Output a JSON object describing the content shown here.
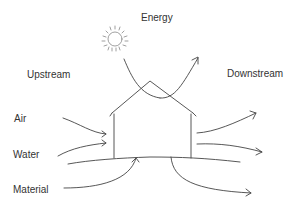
{
  "diagram": {
    "labels": {
      "energy": "Energy",
      "upstream": "Upstream",
      "downstream": "Downstream",
      "air": "Air",
      "water": "Water",
      "material": "Material"
    },
    "icons": {
      "sun": "sun-icon",
      "house": "house-outline"
    },
    "colors": {
      "stroke": "#444444",
      "text": "#333333",
      "background": "#ffffff"
    }
  }
}
